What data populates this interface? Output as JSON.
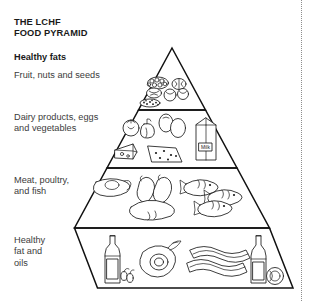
{
  "document": {
    "title": "THE LCHF\nFOOD PYRAMID",
    "background_color": "#ffffff",
    "ink_color": "#111111"
  },
  "pyramid": {
    "shape": "triangle",
    "tier_count": 4,
    "tiers": [
      {
        "index": 1,
        "position": "apex",
        "heading": "Healthy fats",
        "label": "Fruit, nuts and seeds",
        "foods": [
          "berries",
          "walnut",
          "almonds",
          "seeds",
          "nuts"
        ]
      },
      {
        "index": 2,
        "position": "upper-middle",
        "heading": "",
        "label": "Dairy products, eggs\nand vegetables",
        "foods": [
          "tomato",
          "bell pepper",
          "eggs",
          "milk carton",
          "cheese wedge",
          "cheese slice"
        ]
      },
      {
        "index": 3,
        "position": "lower-middle",
        "heading": "",
        "label": "Meat, poultry,\nand fish",
        "foods": [
          "steak",
          "chicken drumsticks",
          "whole chicken",
          "fish",
          "fish",
          "fish"
        ]
      },
      {
        "index": 4,
        "position": "base",
        "heading": "",
        "label": "Healthy\nfat and\noils",
        "foods": [
          "olive oil bottle",
          "olives",
          "avocado",
          "bacon strips",
          "oil bottle",
          "butter"
        ]
      }
    ]
  },
  "decorations": {
    "right_rule": "dotted-vertical-divider"
  }
}
